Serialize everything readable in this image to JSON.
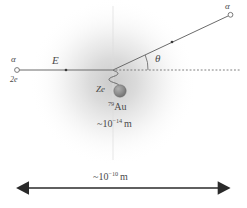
{
  "diagram": {
    "colors": {
      "ink": "#4a4a4a",
      "line": "#6b6b6b",
      "arrow": "#2a2a2a",
      "nucleus": "#8c8c8c",
      "cloud": "#b9b9b9"
    },
    "labels": {
      "incoming_particle": "α",
      "incoming_charge": "2e",
      "energy": "E",
      "scattered_particle": "α",
      "scattering_angle": "θ",
      "nucleus_charge": "Ze",
      "nucleus_element_mass": "79",
      "nucleus_element": "Au",
      "nucleus_size_prefix": "~10",
      "nucleus_size_exponent": "−14",
      "nucleus_size_unit": "m",
      "atom_size_prefix": "~10",
      "atom_size_exponent": "−10",
      "atom_size_unit": "m"
    },
    "geometry": {
      "incoming_ray": {
        "x1": 17,
        "y1": 70,
        "x2": 113,
        "y2": 70
      },
      "outgoing_ray": {
        "x1": 113,
        "y1": 70,
        "x2": 228,
        "y2": 16
      },
      "axis_dashed": {
        "x1": 116,
        "y1": 70,
        "x2": 240,
        "y2": 70
      },
      "vertex": {
        "x": 113,
        "y": 70
      },
      "nucleus": {
        "cx": 120,
        "cy": 91,
        "r": 6
      },
      "cloud": {
        "cx": 113,
        "cy": 82,
        "r": 84
      },
      "incoming_marker": {
        "cx": 66,
        "cy": 70,
        "r": 1.3
      },
      "outgoing_marker": {
        "cx": 172,
        "cy": 42,
        "r": 1.3
      },
      "incoming_open_circle": {
        "cx": 17,
        "cy": 70,
        "r": 2.4
      },
      "outgoing_open_circle": {
        "cx": 230,
        "cy": 15,
        "r": 2.4
      },
      "theta_arc_radius": 34,
      "scale_arrow": {
        "x1": 28,
        "y1": 188,
        "x2": 219,
        "y2": 188
      }
    }
  }
}
